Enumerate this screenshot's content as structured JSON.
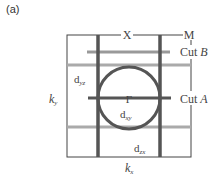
{
  "panel": {
    "label": "(a)"
  },
  "diagram": {
    "type": "brillouin-zone-cuts",
    "points": {
      "X": "X",
      "M": "M",
      "Gamma": "Γ"
    },
    "cuts": {
      "B": {
        "prefix": "Cut ",
        "name": "B"
      },
      "A": {
        "prefix": "Cut ",
        "name": "A"
      }
    },
    "orbitals": {
      "dyz": {
        "base": "d",
        "sub": "yz"
      },
      "dxy": {
        "base": "d",
        "sub": "xy"
      },
      "dzx": {
        "base": "d",
        "sub": "zx"
      }
    },
    "axes": {
      "kx": {
        "base": "k",
        "sub": "x"
      },
      "ky": {
        "base": "k",
        "sub": "y"
      }
    },
    "colors": {
      "frame": "#444444",
      "thick_line": "#555555",
      "gray_line": "#aaaaaa",
      "circle": "#555555"
    }
  }
}
